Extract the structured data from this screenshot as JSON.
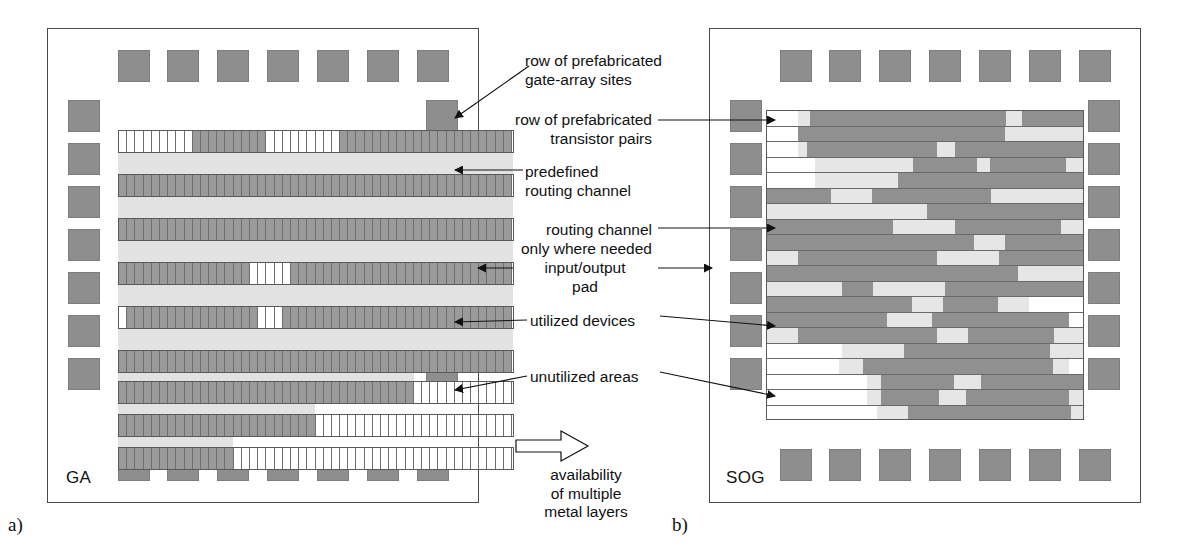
{
  "figure": {
    "panel_a_tag": "a)",
    "panel_b_tag": "b)",
    "panel_a_name": "GA",
    "panel_b_name": "SOG"
  },
  "annotations": {
    "gate_array_sites": "row of prefabricated\ngate-array sites",
    "transistor_pairs": "row of prefabricated\ntransistor pairs",
    "predefined_routing": "predefined\nrouting channel",
    "routing_where_needed": "routing channel\nonly where needed",
    "io_pad": "input/output\npad",
    "utilized_devices": "utilized devices",
    "unutilized_areas": "unutilized areas",
    "transition": "availability\nof multiple\nmetal layers"
  },
  "colors": {
    "pad": "#8e8e8e",
    "utilized": "#9a9a9a",
    "routing_channel": "#e2e2e2",
    "unutilized": "#ffffff",
    "outline": "#4a4a4a"
  },
  "icons": {
    "transition_arrow": "hollow-right-arrow-icon"
  },
  "ga_layout": {
    "pads_top": 7,
    "pads_bottom": 7,
    "pads_left": 7,
    "pads_right": 7,
    "cell_width": 8.2,
    "rows": [
      {
        "top": 102,
        "height": 23,
        "segments": [
          {
            "state": "free",
            "cells": 9
          },
          {
            "state": "used",
            "cells": 9
          },
          {
            "state": "free",
            "cells": 9
          },
          {
            "state": "used",
            "cells": 21
          }
        ]
      },
      {
        "top": 146,
        "height": 23,
        "segments": [
          {
            "state": "used",
            "cells": 48
          }
        ]
      },
      {
        "top": 190,
        "height": 23,
        "segments": [
          {
            "state": "used",
            "cells": 48
          }
        ]
      },
      {
        "top": 234,
        "height": 23,
        "segments": [
          {
            "state": "used",
            "cells": 16
          },
          {
            "state": "free",
            "cells": 5
          },
          {
            "state": "used",
            "cells": 27
          }
        ]
      },
      {
        "top": 278,
        "height": 23,
        "segments": [
          {
            "state": "free",
            "cells": 1
          },
          {
            "state": "used",
            "cells": 16
          },
          {
            "state": "free",
            "cells": 3
          },
          {
            "state": "used",
            "cells": 28
          }
        ]
      },
      {
        "top": 322,
        "height": 23,
        "segments": [
          {
            "state": "used",
            "cells": 48
          }
        ]
      },
      {
        "top": 353,
        "height": 23,
        "segments": [
          {
            "state": "used",
            "cells": 36
          },
          {
            "state": "free",
            "cells": 12
          }
        ]
      },
      {
        "top": 386,
        "height": 23,
        "segments": [
          {
            "state": "used",
            "cells": 24
          },
          {
            "state": "free",
            "cells": 24
          }
        ]
      },
      {
        "top": 419,
        "height": 23,
        "segments": [
          {
            "state": "used",
            "cells": 14
          },
          {
            "state": "free",
            "cells": 34
          }
        ]
      }
    ],
    "channels": [
      {
        "top": 125,
        "left": 0,
        "width": 395,
        "height": 21
      },
      {
        "top": 169,
        "left": 0,
        "width": 395,
        "height": 21
      },
      {
        "top": 213,
        "left": 0,
        "width": 395,
        "height": 21
      },
      {
        "top": 257,
        "left": 0,
        "width": 395,
        "height": 21
      },
      {
        "top": 301,
        "left": 0,
        "width": 395,
        "height": 21
      },
      {
        "top": 345,
        "left": 0,
        "width": 296,
        "height": 8
      },
      {
        "top": 376,
        "left": 0,
        "width": 197,
        "height": 10
      },
      {
        "top": 409,
        "left": 0,
        "width": 115,
        "height": 10
      }
    ]
  },
  "sog_layout": {
    "pads_top": 7,
    "pads_bottom": 7,
    "pads_left": 7,
    "pads_right": 7,
    "rows": [
      {
        "segments": [
          {
            "t": "empty",
            "w": 31
          },
          {
            "t": "chan",
            "w": 12
          },
          {
            "t": "dev",
            "w": 196
          },
          {
            "t": "chan",
            "w": 16
          },
          {
            "t": "dev",
            "w": 63
          }
        ]
      },
      {
        "segments": [
          {
            "t": "empty",
            "w": 31
          },
          {
            "t": "dev",
            "w": 207
          },
          {
            "t": "chan",
            "w": 80
          }
        ]
      },
      {
        "segments": [
          {
            "t": "empty",
            "w": 31
          },
          {
            "t": "chan",
            "w": 9
          },
          {
            "t": "dev",
            "w": 130
          },
          {
            "t": "chan",
            "w": 18
          },
          {
            "t": "dev",
            "w": 130
          }
        ]
      },
      {
        "segments": [
          {
            "t": "empty",
            "w": 48
          },
          {
            "t": "chan",
            "w": 98
          },
          {
            "t": "dev",
            "w": 64
          },
          {
            "t": "chan",
            "w": 13
          },
          {
            "t": "dev",
            "w": 76
          },
          {
            "t": "chan",
            "w": 19
          }
        ]
      },
      {
        "segments": [
          {
            "t": "empty",
            "w": 48
          },
          {
            "t": "chan",
            "w": 83
          },
          {
            "t": "dev",
            "w": 187
          }
        ]
      },
      {
        "segments": [
          {
            "t": "dev",
            "w": 64
          },
          {
            "t": "chan",
            "w": 41
          },
          {
            "t": "dev",
            "w": 119
          },
          {
            "t": "chan",
            "w": 94
          }
        ]
      },
      {
        "segments": [
          {
            "t": "chan",
            "w": 160
          },
          {
            "t": "dev",
            "w": 158
          }
        ]
      },
      {
        "segments": [
          {
            "t": "dev",
            "w": 126
          },
          {
            "t": "chan",
            "w": 62
          },
          {
            "t": "dev",
            "w": 106
          },
          {
            "t": "chan",
            "w": 24
          }
        ]
      },
      {
        "segments": [
          {
            "t": "dev",
            "w": 207
          },
          {
            "t": "chan",
            "w": 31
          },
          {
            "t": "dev",
            "w": 80
          }
        ]
      },
      {
        "segments": [
          {
            "t": "chan",
            "w": 31
          },
          {
            "t": "dev",
            "w": 139
          },
          {
            "t": "chan",
            "w": 62
          },
          {
            "t": "dev",
            "w": 86
          }
        ]
      },
      {
        "segments": [
          {
            "t": "dev",
            "w": 251
          },
          {
            "t": "chan",
            "w": 67
          }
        ]
      },
      {
        "segments": [
          {
            "t": "chan",
            "w": 75
          },
          {
            "t": "dev",
            "w": 31
          },
          {
            "t": "chan",
            "w": 72
          },
          {
            "t": "dev",
            "w": 140
          }
        ]
      },
      {
        "segments": [
          {
            "t": "dev",
            "w": 145
          },
          {
            "t": "chan",
            "w": 31
          },
          {
            "t": "dev",
            "w": 55
          },
          {
            "t": "chan",
            "w": 31
          },
          {
            "t": "empty",
            "w": 56
          }
        ]
      },
      {
        "segments": [
          {
            "t": "dev",
            "w": 120
          },
          {
            "t": "chan",
            "w": 45
          },
          {
            "t": "dev",
            "w": 137
          },
          {
            "t": "empty",
            "w": 16
          }
        ]
      },
      {
        "segments": [
          {
            "t": "chan",
            "w": 31
          },
          {
            "t": "dev",
            "w": 139
          },
          {
            "t": "chan",
            "w": 31
          },
          {
            "t": "dev",
            "w": 86
          },
          {
            "t": "chan",
            "w": 31
          }
        ]
      },
      {
        "segments": [
          {
            "t": "empty",
            "w": 75
          },
          {
            "t": "chan",
            "w": 62
          },
          {
            "t": "dev",
            "w": 146
          },
          {
            "t": "chan",
            "w": 35
          }
        ]
      },
      {
        "segments": [
          {
            "t": "empty",
            "w": 72
          },
          {
            "t": "chan",
            "w": 24
          },
          {
            "t": "dev",
            "w": 190
          },
          {
            "t": "chan",
            "w": 16
          },
          {
            "t": "empty",
            "w": 16
          }
        ]
      },
      {
        "segments": [
          {
            "t": "empty",
            "w": 100
          },
          {
            "t": "chan",
            "w": 14
          },
          {
            "t": "dev",
            "w": 73
          },
          {
            "t": "chan",
            "w": 27
          },
          {
            "t": "dev",
            "w": 104
          }
        ]
      },
      {
        "segments": [
          {
            "t": "empty",
            "w": 100
          },
          {
            "t": "chan",
            "w": 14
          },
          {
            "t": "dev",
            "w": 58
          },
          {
            "t": "chan",
            "w": 27
          },
          {
            "t": "dev",
            "w": 103
          },
          {
            "t": "chan",
            "w": 16
          }
        ]
      },
      {
        "segments": [
          {
            "t": "empty",
            "w": 110
          },
          {
            "t": "chan",
            "w": 31
          },
          {
            "t": "dev",
            "w": 163
          },
          {
            "t": "chan",
            "w": 14
          }
        ]
      }
    ]
  }
}
